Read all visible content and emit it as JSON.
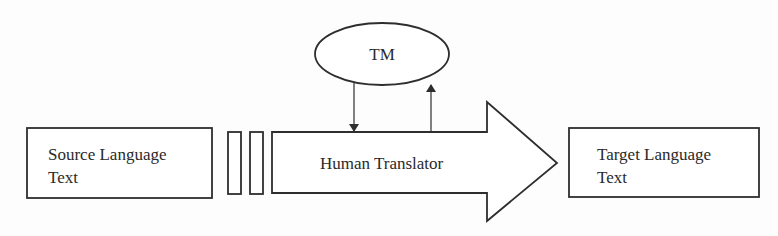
{
  "diagram": {
    "type": "flow",
    "nodes": {
      "source": {
        "lines": [
          "Source Language",
          "Text"
        ]
      },
      "translator": {
        "label": "Human Translator"
      },
      "tm": {
        "label": "TM"
      },
      "target": {
        "lines": [
          "Target Language",
          "Text"
        ]
      }
    },
    "edges": [
      {
        "from": "source",
        "to": "translator",
        "style": "segment-bars"
      },
      {
        "from": "tm",
        "to": "translator",
        "style": "arrow"
      },
      {
        "from": "translator",
        "to": "tm",
        "style": "arrow"
      },
      {
        "from": "translator",
        "to": "target",
        "style": "block-arrow"
      }
    ]
  }
}
